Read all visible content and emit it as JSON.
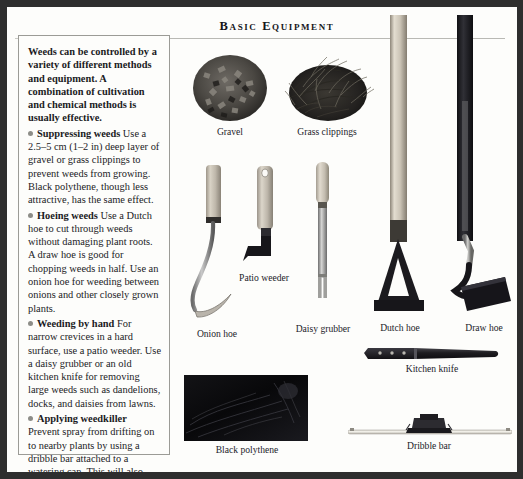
{
  "page": {
    "title": "Basic Equipment",
    "background_color": "#fdfdfb",
    "frame_color": "#2e2e2e",
    "rule_color": "#b9b9b4"
  },
  "text_panel": {
    "intro": "Weeds can be controlled by a variety of different methods and equipment. A combination of cultivation and chemical methods is usually effective.",
    "bullets": [
      {
        "term": "Suppressing weeds",
        "body": "Use a 2.5–5 cm (1–2 in) deep layer of gravel or grass clippings to prevent weeds from growing. Black polythene, though less attractive, has the same effect."
      },
      {
        "term": "Hoeing weeds",
        "body": "Use a Dutch hoe to cut through weeds without damaging plant roots. A draw hoe is good for chopping weeds in half. Use an onion hoe for weeding between onions and other closely grown plants."
      },
      {
        "term": "Weeding by hand",
        "body": "For narrow crevices in a hard surface, use a patio weeder. Use a daisy grubber or an old kitchen knife for removing large weeds such as dandelions, docks, and daisies from lawns."
      },
      {
        "term": "Applying weedkiller",
        "body": "Prevent spray from drifting on to nearby plants by using a dribble bar attached to a watering can. This will also help you to apply weedkiller accurately."
      }
    ],
    "bullet_marker_color": "#8d8d88"
  },
  "figures": [
    {
      "id": "gravel",
      "caption": "Gravel",
      "kind": "pile-photo"
    },
    {
      "id": "grass-clippings",
      "caption": "Grass clippings",
      "kind": "pile-photo"
    },
    {
      "id": "patio-weeder",
      "caption": "Patio weeder",
      "kind": "hand-tool"
    },
    {
      "id": "onion-hoe",
      "caption": "Onion hoe",
      "kind": "hand-tool"
    },
    {
      "id": "daisy-grubber",
      "caption": "Daisy grubber",
      "kind": "hand-tool"
    },
    {
      "id": "dutch-hoe",
      "caption": "Dutch hoe",
      "kind": "long-tool"
    },
    {
      "id": "draw-hoe",
      "caption": "Draw hoe",
      "kind": "long-tool"
    },
    {
      "id": "kitchen-knife",
      "caption": "Kitchen knife",
      "kind": "hand-tool"
    },
    {
      "id": "black-polythene",
      "caption": "Black polythene",
      "kind": "sheet-photo"
    },
    {
      "id": "dribble-bar",
      "caption": "Dribble bar",
      "kind": "long-tool"
    }
  ]
}
